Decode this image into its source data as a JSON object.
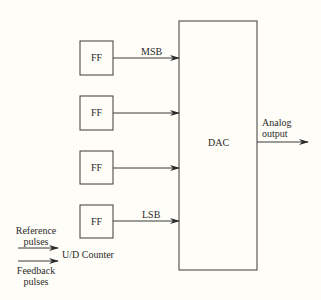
{
  "diagram": {
    "ff_blocks": [
      {
        "label": "FF",
        "bit_label": "MSB"
      },
      {
        "label": "FF",
        "bit_label": ""
      },
      {
        "label": "FF",
        "bit_label": ""
      },
      {
        "label": "FF",
        "bit_label": "LSB"
      }
    ],
    "dac": {
      "label": "DAC"
    },
    "output": {
      "line1": "Analog",
      "line2": "output"
    },
    "counter": {
      "label": "U/D Counter"
    },
    "inputs": {
      "reference_line1": "Reference",
      "reference_line2": "pulses",
      "feedback_line1": "Feedback",
      "feedback_line2": "pulses"
    },
    "colors": {
      "stroke": "#3a3a3a",
      "background": "#fefdf8"
    }
  }
}
